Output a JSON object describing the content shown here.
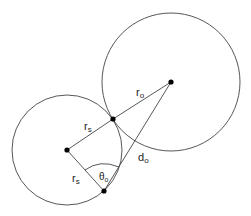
{
  "diagram": {
    "colors": {
      "stroke": "#444444",
      "point": "#000000",
      "background": "#ffffff"
    },
    "small_circle": {
      "cx": 67,
      "cy": 150,
      "r": 55
    },
    "large_circle": {
      "cx": 171,
      "cy": 82,
      "r": 69
    },
    "points": {
      "small_center": {
        "x": 67,
        "y": 150
      },
      "contact": {
        "x": 113,
        "y": 119
      },
      "large_center": {
        "x": 171,
        "y": 82
      },
      "bottom": {
        "x": 104,
        "y": 191
      }
    },
    "labels": {
      "r_o": {
        "main": "r",
        "sub": "o"
      },
      "r_s_upper": {
        "main": "r",
        "sub": "s"
      },
      "r_s_lower": {
        "main": "r",
        "sub": "s"
      },
      "d_o": {
        "main": "d",
        "sub": "o"
      },
      "theta_o": {
        "main": "θ",
        "sub": "o"
      }
    }
  }
}
